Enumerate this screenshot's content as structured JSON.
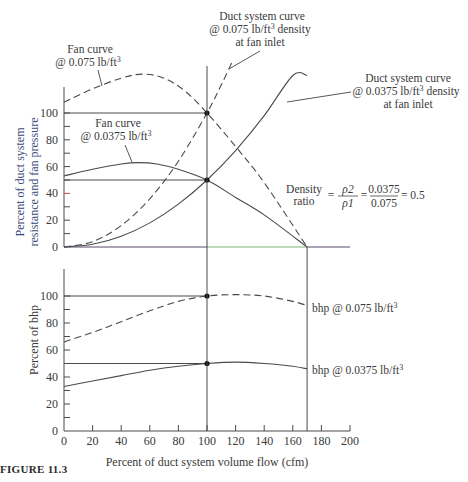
{
  "figure": {
    "caption": "FIGURE 11.3"
  },
  "chart_data": [
    {
      "type": "line",
      "panel": "top",
      "title": "",
      "xlabel": "",
      "ylabel": "Percent of duct system resistance and fan pressure",
      "xlim": [
        0,
        200
      ],
      "ylim": [
        0,
        100
      ],
      "yticks": [
        0,
        20,
        40,
        60,
        80,
        100
      ],
      "ymajor_step": 10,
      "series": [
        {
          "name": "Fan curve @ 0.075 lb/ft3",
          "style": "dashed",
          "x": [
            0,
            20,
            40,
            55,
            70,
            85,
            100,
            120,
            140,
            170
          ],
          "y": [
            108,
            118,
            126,
            129,
            126,
            116,
            100,
            75,
            48,
            0
          ]
        },
        {
          "name": "Fan curve @ 0.0375 lb/ft3",
          "style": "solid",
          "x": [
            0,
            20,
            40,
            52,
            65,
            80,
            100,
            120,
            140,
            170
          ],
          "y": [
            53,
            58,
            62,
            63,
            62,
            58,
            50,
            37,
            24,
            0
          ]
        },
        {
          "name": "Duct system curve @ 0.075 lb/ft3 density at fan inlet",
          "style": "dashed",
          "x": [
            0,
            20,
            40,
            60,
            80,
            100,
            110,
            118
          ],
          "y": [
            0,
            4,
            16,
            36,
            64,
            100,
            121,
            139
          ]
        },
        {
          "name": "Duct system curve @ 0.0375 lb/ft3 density at fan inlet",
          "style": "solid",
          "x": [
            0,
            20,
            40,
            60,
            80,
            100,
            120,
            140,
            160,
            170
          ],
          "y": [
            0,
            2,
            8,
            18,
            32,
            50,
            72,
            98,
            128,
            128
          ]
        }
      ],
      "reference_lines": {
        "horizontal": [
          100,
          50
        ],
        "vertical": [
          100,
          170
        ]
      },
      "points": [
        {
          "x": 100,
          "y": 100
        },
        {
          "x": 100,
          "y": 50
        }
      ],
      "annotations": [
        {
          "text_lines": [
            "Fan curve",
            "@ 0.075 lb/ft³"
          ]
        },
        {
          "text_lines": [
            "Fan curve",
            "@ 0.0375 lb/ft³"
          ]
        },
        {
          "text_lines": [
            "Duct system curve",
            "@ 0.075 lb/ft³ density",
            "at fan inlet"
          ]
        },
        {
          "text_lines": [
            "Duct system curve",
            "@ 0.0375 lb/ft³ density",
            "at fan inlet"
          ]
        },
        {
          "text": "Density ratio = ρ2/ρ1 = 0.0375/0.075 = 0.5"
        }
      ]
    },
    {
      "type": "line",
      "panel": "bottom",
      "title": "",
      "xlabel": "Percent of duct system volume flow (cfm)",
      "ylabel": "Percent of bhp",
      "xlim": [
        0,
        200
      ],
      "ylim": [
        0,
        100
      ],
      "xticks": [
        0,
        20,
        40,
        60,
        80,
        100,
        120,
        140,
        160,
        180,
        200
      ],
      "yticks": [
        0,
        20,
        40,
        60,
        80,
        100
      ],
      "series": [
        {
          "name": "bhp @ 0.075 lb/ft3",
          "style": "dashed",
          "x": [
            0,
            20,
            40,
            60,
            80,
            100,
            120,
            140,
            160,
            170
          ],
          "y": [
            66,
            73,
            81,
            89,
            96,
            100,
            101,
            100,
            96,
            93
          ]
        },
        {
          "name": "bhp @ 0.0375 lb/ft3",
          "style": "solid",
          "x": [
            0,
            20,
            40,
            60,
            80,
            100,
            120,
            140,
            160,
            170
          ],
          "y": [
            33,
            37,
            41,
            45,
            48,
            50,
            51,
            50,
            48,
            46
          ]
        }
      ],
      "reference_lines": {
        "horizontal": [
          100,
          50
        ],
        "vertical": [
          100,
          170
        ]
      },
      "points": [
        {
          "x": 100,
          "y": 100
        },
        {
          "x": 100,
          "y": 50
        }
      ]
    }
  ],
  "labels": {
    "top_y_title_1": "Percent of duct system",
    "top_y_title_2": "resistance and fan pressure",
    "bottom_y_title": "Percent of bhp",
    "x_title": "Percent of duct system volume flow (cfm)",
    "fan075_l1": "Fan curve",
    "fan075_l2": "@ 0.075 lb/ft",
    "fan0375_l1": "Fan curve",
    "fan0375_l2": "@ 0.0375 lb/ft",
    "duct075_l1": "Duct system curve",
    "duct075_l2a": "@ 0.075 lb/ft",
    "duct075_l2b": " density",
    "duct075_l3": "at fan inlet",
    "duct0375_l1": "Duct system curve",
    "duct0375_l2a": "@ 0.0375 lb/ft",
    "duct0375_l2b": " density",
    "duct0375_l3": "at fan inlet",
    "cube": "3",
    "density_word": "Density",
    "ratio_word": "ratio",
    "eq1": "=",
    "rho2": "ρ2",
    "rho1": "ρ1",
    "eq2": "=",
    "num": "0.0375",
    "den": "0.075",
    "eq3": "= 0.5",
    "bhp075": "bhp @ 0.075 lb/ft",
    "bhp0375": "bhp @ 0.0375 lb/ft"
  }
}
